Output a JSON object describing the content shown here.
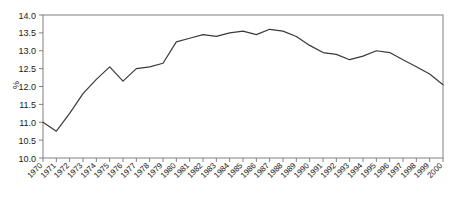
{
  "chart_data": {
    "type": "line",
    "title": "",
    "subtitle": "",
    "xlabel": "",
    "ylabel": "%",
    "x": [
      1970,
      1971,
      1972,
      1973,
      1974,
      1975,
      1976,
      1977,
      1978,
      1979,
      1980,
      1981,
      1982,
      1983,
      1984,
      1985,
      1986,
      1987,
      1988,
      1989,
      1990,
      1991,
      1992,
      1993,
      1994,
      1995,
      1996,
      1997,
      1998,
      1999,
      2000
    ],
    "categories": [
      "1970",
      "1971",
      "1972",
      "1973",
      "1974",
      "1975",
      "1976",
      "1977",
      "1978",
      "1979",
      "1980",
      "1981",
      "1982",
      "1983",
      "1984",
      "1985",
      "1986",
      "1987",
      "1988",
      "1989",
      "1990",
      "1991",
      "1992",
      "1993",
      "1994",
      "1995",
      "1996",
      "1997",
      "1998",
      "1999",
      "2000"
    ],
    "values": [
      11.0,
      10.75,
      11.25,
      11.8,
      12.2,
      12.55,
      12.15,
      12.5,
      12.55,
      12.65,
      13.25,
      13.35,
      13.45,
      13.4,
      13.5,
      13.55,
      13.45,
      13.6,
      13.55,
      13.4,
      13.15,
      12.95,
      12.9,
      12.75,
      12.85,
      13.0,
      12.95,
      12.75,
      12.55,
      12.35,
      12.05
    ],
    "series": [
      {
        "name": "",
        "values": [
          11.0,
          10.75,
          11.25,
          11.8,
          12.2,
          12.55,
          12.15,
          12.5,
          12.55,
          12.65,
          13.25,
          13.35,
          13.45,
          13.4,
          13.5,
          13.55,
          13.45,
          13.6,
          13.55,
          13.4,
          13.15,
          12.95,
          12.9,
          12.75,
          12.85,
          13.0,
          12.95,
          12.75,
          12.55,
          12.35,
          12.05
        ],
        "color": "#3a3a3a"
      }
    ],
    "ylim": [
      10.0,
      14.0
    ],
    "yticks": [
      10.0,
      10.5,
      11.0,
      11.5,
      12.0,
      12.5,
      13.0,
      13.5,
      14.0
    ],
    "ytick_labels": [
      "10.0",
      "10.5",
      "11.0",
      "11.5",
      "12.0",
      "12.5",
      "13.0",
      "13.5",
      "14.0"
    ],
    "xtick_rotation": 45,
    "grid": false,
    "legend": false,
    "legend_position": "none",
    "frame": true,
    "line_color": "#3a3a3a",
    "axis_color": "#808080",
    "text_color": "#1a1a1a",
    "background_color": "#ffffff"
  }
}
